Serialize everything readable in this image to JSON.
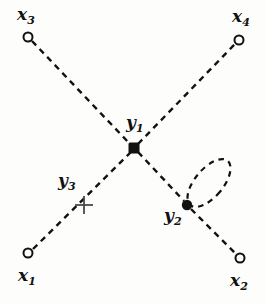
{
  "figure": {
    "background_color": "#fdfdfb",
    "ink_color": "#111111",
    "line_style": "dashed",
    "width": 266,
    "height": 305
  },
  "nodes": [
    {
      "id": "x3",
      "label_main": "x",
      "label_sub": "3",
      "marker": "open-circle",
      "x": 28,
      "y": 37,
      "radius": 4.5,
      "label_x": 17,
      "label_y": 6
    },
    {
      "id": "x4",
      "label_main": "x",
      "label_sub": "4",
      "marker": "open-circle",
      "x": 239,
      "y": 40,
      "radius": 4.5,
      "label_x": 232,
      "label_y": 8
    },
    {
      "id": "x1",
      "label_main": "x",
      "label_sub": "1",
      "marker": "open-circle",
      "x": 28,
      "y": 253,
      "radius": 4.5,
      "label_x": 18,
      "label_y": 267
    },
    {
      "id": "x2",
      "label_main": "x",
      "label_sub": "2",
      "marker": "open-circle",
      "x": 240,
      "y": 258,
      "radius": 4.5,
      "label_x": 230,
      "label_y": 272
    },
    {
      "id": "y1",
      "label_main": "y",
      "label_sub": "1",
      "marker": "filled-square",
      "x": 134,
      "y": 148,
      "size": 9,
      "label_x": 126,
      "label_y": 114
    },
    {
      "id": "y2",
      "label_main": "y",
      "label_sub": "2",
      "marker": "filled-dot",
      "x": 187,
      "y": 205,
      "radius": 5,
      "label_x": 164,
      "label_y": 207
    },
    {
      "id": "y3",
      "label_main": "y",
      "label_sub": "3",
      "marker": "cross",
      "x": 84,
      "y": 205,
      "size": 9,
      "label_x": 58,
      "label_y": 172
    }
  ],
  "edges": [
    {
      "id": "edge-x1-y1",
      "from": "x1",
      "to": "y1",
      "style": "dashed",
      "x1": 33,
      "y1": 249,
      "x2": 131,
      "y2": 152
    },
    {
      "id": "edge-y1-x4",
      "from": "y1",
      "to": "x4",
      "style": "dashed",
      "x1": 138,
      "y1": 144,
      "x2": 235,
      "y2": 44
    },
    {
      "id": "edge-x3-y1",
      "from": "x3",
      "to": "y1",
      "style": "dashed",
      "x1": 32,
      "y1": 41,
      "x2": 130,
      "y2": 144
    },
    {
      "id": "edge-y1-y2",
      "from": "y1",
      "to": "y2",
      "style": "dashed",
      "x1": 138,
      "y1": 152,
      "x2": 184,
      "y2": 201
    },
    {
      "id": "edge-y2-x2",
      "from": "y2",
      "to": "x2",
      "style": "dashed",
      "x1": 191,
      "y1": 209,
      "x2": 236,
      "y2": 254
    }
  ],
  "self_loop": {
    "id": "loop-y2",
    "at_node": "y2",
    "style": "dashed",
    "center_x": 209,
    "center_y": 183,
    "radius_x": 14,
    "radius_y": 29,
    "rotation_deg": 40
  }
}
